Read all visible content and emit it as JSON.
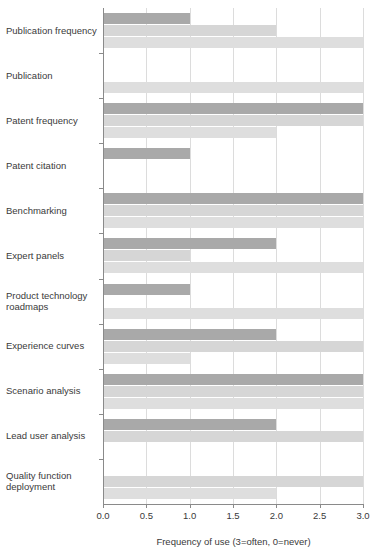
{
  "chart_data": {
    "type": "bar",
    "orientation": "horizontal",
    "title": "",
    "subtitle": "",
    "xlabel": "Frequency of use (3=often, 0=never)",
    "ylabel": "",
    "xlim": [
      0.0,
      3.0
    ],
    "xticks": [
      0.0,
      0.5,
      1.0,
      1.5,
      2.0,
      2.5,
      3.0
    ],
    "xtick_labels": [
      "0.0",
      "0.5",
      "1.0",
      "1.5",
      "2.0",
      "2.5",
      "3.0"
    ],
    "grid": true,
    "grid_axis": "x",
    "legend": false,
    "legend_position": "none",
    "categories": [
      "Publication frequency",
      "Publication",
      "Patent frequency",
      "Patent citation",
      "Benchmarking",
      "Expert panels",
      "Product technology roadmaps",
      "Experience curves",
      "Scenario analysis",
      "Lead user analysis",
      "Quality function deployment"
    ],
    "series": [
      {
        "name": "series-1",
        "color": "#a9a9a9",
        "values": [
          1.0,
          0.0,
          3.0,
          1.0,
          3.0,
          2.0,
          1.0,
          2.0,
          3.0,
          2.0,
          0.0
        ]
      },
      {
        "name": "series-2",
        "color": "#d6d6d6",
        "values": [
          2.0,
          0.0,
          3.0,
          0.0,
          3.0,
          1.0,
          0.0,
          3.0,
          3.0,
          3.0,
          3.0
        ]
      },
      {
        "name": "series-3",
        "color": "#dedede",
        "values": [
          3.0,
          3.0,
          2.0,
          0.0,
          3.0,
          3.0,
          3.0,
          1.0,
          3.0,
          0.0,
          2.0
        ]
      }
    ]
  }
}
